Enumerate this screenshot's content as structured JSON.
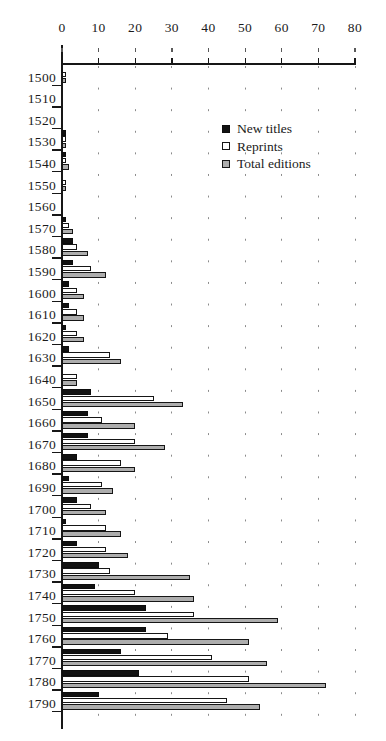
{
  "chart_data": {
    "type": "bar",
    "orientation": "horizontal",
    "title": "",
    "xlabel": "",
    "ylabel": "",
    "xlim": [
      0,
      80
    ],
    "xticks": [
      0,
      10,
      20,
      30,
      40,
      50,
      60,
      70,
      80
    ],
    "xtick_labels": [
      "0",
      "10",
      "20",
      "30",
      "40",
      "50",
      "60",
      "70",
      "80"
    ],
    "grid": "dotted-vertical",
    "legend_position": "upper-right-inside",
    "categories": [
      "1500",
      "1510",
      "1520",
      "1530",
      "1540",
      "1550",
      "1560",
      "1570",
      "1580",
      "1590",
      "1600",
      "1610",
      "1620",
      "1630",
      "1640",
      "1650",
      "1660",
      "1670",
      "1680",
      "1690",
      "1700",
      "1710",
      "1720",
      "1730",
      "1740",
      "1750",
      "1760",
      "1770",
      "1780",
      "1790"
    ],
    "series": [
      {
        "name": "New titles",
        "color": "#121212",
        "values": [
          0,
          0,
          0,
          1,
          1,
          0,
          0,
          1,
          3,
          3,
          2,
          2,
          1,
          2,
          0,
          8,
          7,
          7,
          4,
          2,
          4,
          1,
          4,
          10,
          9,
          23,
          23,
          16,
          21,
          10
        ]
      },
      {
        "name": "Reprints",
        "color": "#ffffff",
        "values": [
          1,
          0,
          0,
          1,
          1,
          1,
          0,
          2,
          4,
          8,
          4,
          4,
          4,
          13,
          4,
          25,
          11,
          20,
          16,
          11,
          8,
          12,
          12,
          13,
          20,
          36,
          29,
          41,
          51,
          45
        ]
      },
      {
        "name": "Total editions",
        "color": "#adadad",
        "values": [
          1,
          0,
          0,
          1,
          2,
          1,
          0,
          3,
          7,
          12,
          6,
          6,
          6,
          16,
          4,
          33,
          20,
          28,
          20,
          14,
          12,
          16,
          18,
          35,
          36,
          59,
          51,
          56,
          72,
          54
        ]
      }
    ]
  },
  "legend": {
    "items": [
      {
        "label": "New titles",
        "swatch": "filled-black-square-icon"
      },
      {
        "label": "Reprints",
        "swatch": "outline-white-square-icon"
      },
      {
        "label": "Total editions",
        "swatch": "filled-gray-square-icon"
      }
    ]
  }
}
